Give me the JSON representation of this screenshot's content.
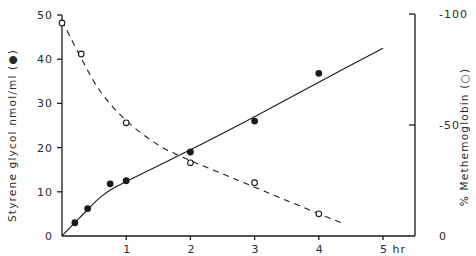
{
  "chart_data": {
    "type": "line",
    "title": "",
    "xlabel": "hr",
    "ylabel": "Styrene glycol nmol/ml (●)",
    "y2label": "% Methemoglobin (○)",
    "xlim": [
      0,
      5.4
    ],
    "ylim": [
      0,
      50
    ],
    "y2lim": [
      0,
      100
    ],
    "x_ticks": [
      1,
      2,
      3,
      4,
      5
    ],
    "x_tick_labels": [
      "1",
      "2",
      "3",
      "4",
      "5 hr"
    ],
    "y_ticks": [
      0,
      10,
      20,
      30,
      40,
      50
    ],
    "y_tick_labels": [
      "0",
      "10",
      "20",
      "30",
      "40",
      "50"
    ],
    "y2_ticks": [
      0,
      50,
      100
    ],
    "y2_tick_labels": [
      "0",
      "-50",
      "-100"
    ],
    "grid": false,
    "legend": "none (markers identified in axis titles)",
    "series": [
      {
        "name": "Styrene glycol (nmol/ml)",
        "axis": "left",
        "marker": "filled-circle",
        "line": "solid",
        "x": [
          0.2,
          0.4,
          0.75,
          1.0,
          2.0,
          3.0,
          4.0
        ],
        "values": [
          3.0,
          6.2,
          11.8,
          12.5,
          19.0,
          26.0,
          36.8
        ],
        "fit_curve": {
          "x": [
            0,
            0.2,
            0.4,
            0.6,
            0.8,
            1.0,
            2.0,
            3.0,
            4.0,
            5.0
          ],
          "y": [
            0,
            3.0,
            6.0,
            8.8,
            10.8,
            12.3,
            19.5,
            27.0,
            34.8,
            42.5
          ]
        }
      },
      {
        "name": "% Methemoglobin",
        "axis": "right",
        "marker": "open-circle",
        "line": "dashed",
        "x": [
          0.0,
          0.3,
          1.0,
          2.0,
          3.0,
          4.0
        ],
        "values": [
          96,
          82,
          51,
          33,
          24,
          10
        ],
        "fit_curve": {
          "x": [
            0,
            0.3,
            0.6,
            1.0,
            1.5,
            2.0,
            2.5,
            3.0,
            3.5,
            4.0,
            4.35
          ],
          "y": [
            97,
            80,
            65,
            52,
            41,
            34,
            28,
            22,
            16,
            10,
            6
          ]
        }
      }
    ]
  },
  "colors": {
    "ink": "#1a1a1a",
    "background": "#ffffff"
  }
}
